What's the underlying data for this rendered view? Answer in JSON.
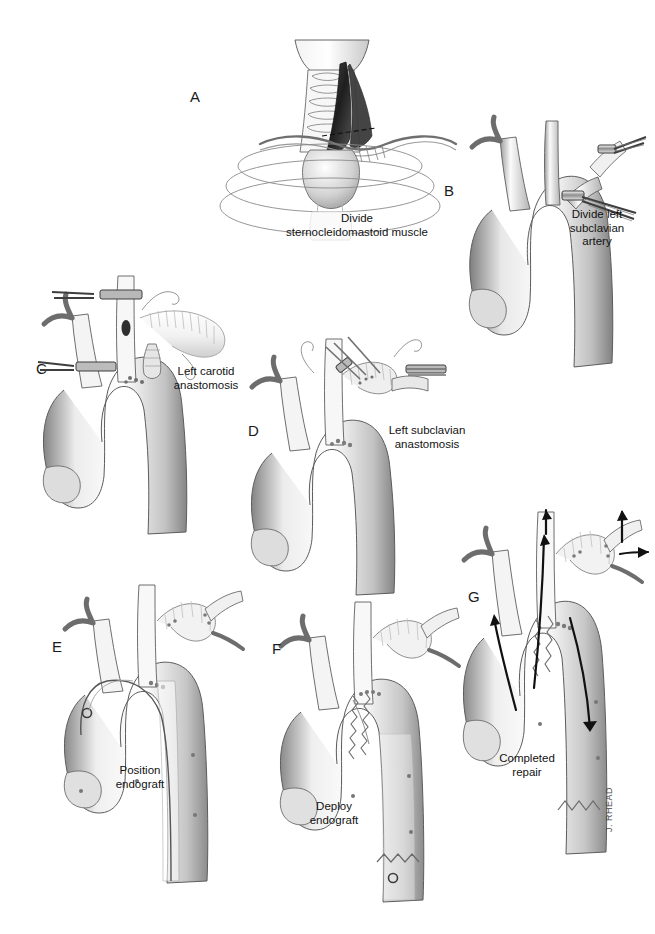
{
  "figure": {
    "background_color": "#ffffff",
    "ink_color": "#1b1b1b",
    "width": 655,
    "height": 934,
    "signature": "J. RHEAD"
  },
  "panels": [
    {
      "letter": "A",
      "caption": "Divide\nsternocleidomastoid muscle",
      "subject": "neck-sternocleidomastoid-division",
      "letter_pos": {
        "x": 190,
        "y": 88
      },
      "caption_pos": {
        "x": 272,
        "y": 212,
        "w": 170
      }
    },
    {
      "letter": "B",
      "caption": "Divide left\nsubclavian\nartery",
      "subject": "aortic-arch-left-subclavian-division",
      "letter_pos": {
        "x": 444,
        "y": 182
      },
      "caption_pos": {
        "x": 552,
        "y": 208,
        "w": 90
      }
    },
    {
      "letter": "C",
      "caption": "Left carotid\nanastomosis",
      "subject": "aortic-arch-left-carotid-anastomosis",
      "letter_pos": {
        "x": 36,
        "y": 360
      },
      "caption_pos": {
        "x": 160,
        "y": 365,
        "w": 92
      }
    },
    {
      "letter": "D",
      "caption": "Left subclavian\nanastomosis",
      "subject": "aortic-arch-left-subclavian-anastomosis",
      "letter_pos": {
        "x": 248,
        "y": 422
      },
      "caption_pos": {
        "x": 372,
        "y": 424,
        "w": 110
      }
    },
    {
      "letter": "E",
      "caption": "Position\nendograft",
      "subject": "aortic-arch-endograft-positioning",
      "letter_pos": {
        "x": 52,
        "y": 638
      },
      "caption_pos": {
        "x": 98,
        "y": 764,
        "w": 84
      }
    },
    {
      "letter": "F",
      "caption": "Deploy\nendograft",
      "subject": "aortic-arch-endograft-deployment",
      "letter_pos": {
        "x": 272,
        "y": 640
      },
      "caption_pos": {
        "x": 292,
        "y": 800,
        "w": 84
      }
    },
    {
      "letter": "G",
      "caption": "Completed\nrepair",
      "subject": "aortic-arch-completed-repair",
      "letter_pos": {
        "x": 468,
        "y": 588
      },
      "caption_pos": {
        "x": 484,
        "y": 752,
        "w": 86
      }
    }
  ]
}
